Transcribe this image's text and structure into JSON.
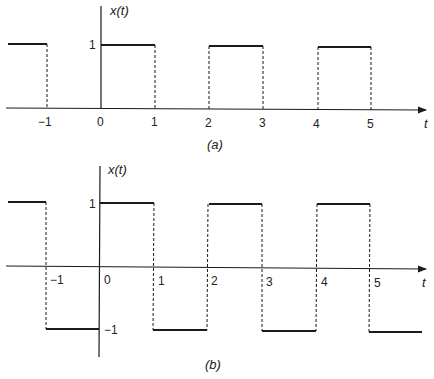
{
  "panels": [
    {
      "id": "a",
      "caption": "(a)",
      "y_label": "x(t)",
      "x_label": "t",
      "y_tick_high": "1",
      "x_ticks": [
        "−1",
        "0",
        "1",
        "2",
        "3",
        "4",
        "5"
      ],
      "description": "Unipolar square wave: x(t)=1 on [2k, 2k+1), 0 otherwise; period 2"
    },
    {
      "id": "b",
      "caption": "(b)",
      "y_label": "x(t)",
      "x_label": "t",
      "y_tick_high": "1",
      "y_tick_low": "−1",
      "x_ticks": [
        "−1",
        "0",
        "1",
        "2",
        "3",
        "4",
        "5"
      ],
      "description": "Bipolar square wave: x(t)=1 on [2k, 2k+1), −1 on [2k−1, 2k); period 2"
    }
  ],
  "colors": {
    "line": "#1a1a1a",
    "background": "#ffffff"
  }
}
